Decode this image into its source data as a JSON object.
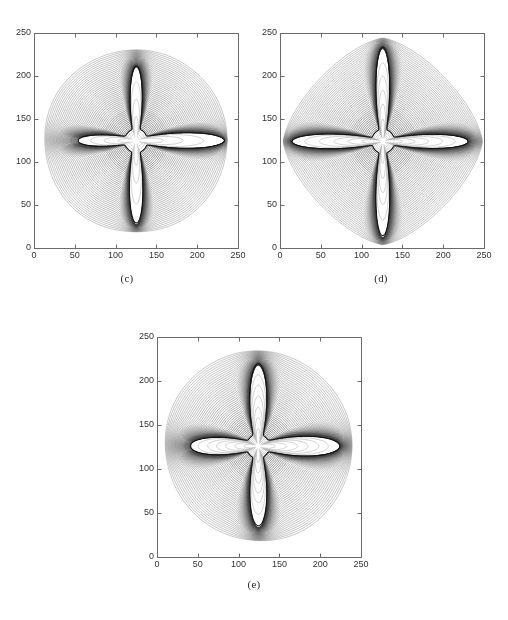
{
  "figure": {
    "background_color": "#ffffff",
    "line_color": "#1a1a1a",
    "axis_color": "#555555",
    "tick_label_color": "#333333",
    "caption_color": "#2b2b2b"
  },
  "chart_data": [
    {
      "type": "contour",
      "panel_label": "(c)",
      "title": "",
      "xlabel": "",
      "ylabel": "",
      "xlim": [
        0,
        250
      ],
      "ylim": [
        0,
        250
      ],
      "xticks": [
        0,
        50,
        100,
        150,
        200,
        250
      ],
      "yticks": [
        0,
        50,
        100,
        150,
        200,
        250
      ],
      "xticklabels": [
        "0",
        "50",
        "100",
        "150",
        "200",
        "250"
      ],
      "yticklabels": [
        "0",
        "50",
        "100",
        "150",
        "200",
        "250"
      ],
      "grid": false,
      "legend": null,
      "tick_direction": "in",
      "description": "Dense nested contour lines around a rough four-armed fractal star; outer contours are rounded ovals, inner contours crowd into a dark rim along the star boundary.",
      "shape": {
        "center": [
          125,
          125
        ],
        "arm_tips": {
          "right": [
            220,
            126
          ],
          "left": [
            70,
            124
          ],
          "up": [
            124,
            200
          ],
          "down": [
            123,
            45
          ]
        },
        "arm_count": 4,
        "roughness": 0.55,
        "outer_contour_extent": {
          "x": [
            18,
            238
          ],
          "y": [
            22,
            228
          ]
        },
        "outer_shape": "rounded-oval",
        "contour_levels": 46
      }
    },
    {
      "type": "contour",
      "panel_label": "(d)",
      "title": "",
      "xlabel": "",
      "ylabel": "",
      "xlim": [
        0,
        250
      ],
      "ylim": [
        0,
        250
      ],
      "xticks": [
        0,
        50,
        100,
        150,
        200,
        250
      ],
      "yticks": [
        0,
        50,
        100,
        150,
        200,
        250
      ],
      "xticklabels": [
        "0",
        "50",
        "100",
        "150",
        "200",
        "250"
      ],
      "yticklabels": [
        "0",
        "50",
        "100",
        "150",
        "200",
        "250"
      ],
      "grid": false,
      "legend": null,
      "tick_direction": "in",
      "description": "Symmetric four-pointed star with long slender arms; outer contours form a diamond / cushion shape with concave sides between arms.",
      "shape": {
        "center": [
          126,
          124
        ],
        "arm_tips": {
          "right": [
            214,
            125
          ],
          "left": [
            25,
            124
          ],
          "up": [
            124,
            220
          ],
          "down": [
            124,
            28
          ]
        },
        "arm_count": 4,
        "roughness": 0.3,
        "outer_contour_extent": {
          "x": [
            8,
            243
          ],
          "y": [
            12,
            238
          ]
        },
        "outer_shape": "diamond-cushion",
        "contour_levels": 46
      }
    },
    {
      "type": "contour",
      "panel_label": "(e)",
      "title": "",
      "xlabel": "",
      "ylabel": "",
      "xlim": [
        0,
        250
      ],
      "ylim": [
        0,
        250
      ],
      "xticks": [
        0,
        50,
        100,
        150,
        200,
        250
      ],
      "yticks": [
        0,
        50,
        100,
        150,
        200,
        250
      ],
      "xticklabels": [
        "0",
        "50",
        "100",
        "150",
        "200",
        "250"
      ],
      "yticklabels": [
        "0",
        "50",
        "100",
        "150",
        "200",
        "250"
      ],
      "grid": false,
      "legend": null,
      "tick_direction": "in",
      "description": "Highly irregular, strongly branched four-armed cluster with thick rough arms and side lobes; outer contours are broad nested ovals.",
      "shape": {
        "center": [
          124,
          126
        ],
        "arm_tips": {
          "right": [
            205,
            124
          ],
          "left": [
            55,
            135
          ],
          "up": [
            122,
            208
          ],
          "down": [
            125,
            50
          ]
        },
        "arm_count": 4,
        "roughness": 0.85,
        "outer_contour_extent": {
          "x": [
            18,
            240
          ],
          "y": [
            16,
            228
          ]
        },
        "outer_shape": "rounded-oval",
        "contour_levels": 46
      }
    }
  ]
}
